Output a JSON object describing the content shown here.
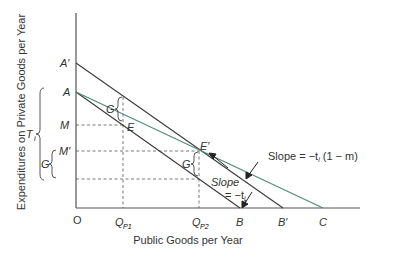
{
  "diagram": {
    "xlabel": "Public Goods per Year",
    "ylabel": "Expenditures on Private Goods per Year",
    "origin": "O",
    "y_points": {
      "A_prime": "A′",
      "A": "A",
      "M": "M",
      "M_prime": "M′"
    },
    "x_points": {
      "Q_P1": "Q",
      "Q_P1_sub": "P1",
      "Q_P2": "Q",
      "Q_P2_sub": "P2",
      "B": "B",
      "B_prime": "B′",
      "C": "C"
    },
    "points": {
      "E": "E",
      "E_prime": "E′"
    },
    "braces": {
      "T_i": "T",
      "T_i_sub": "i",
      "G_left": "G",
      "G_upper": "G",
      "G_lower": "G"
    },
    "annotations": {
      "slope_green_prefix": "Slope = −t",
      "slope_green_sub": "i",
      "slope_green_suffix": " (1 − m)",
      "slope_black_word": "Slope",
      "slope_black_eq": "= −t",
      "slope_black_sub": "i"
    },
    "colors": {
      "line": "#3a3a3a",
      "green_line": "#4f8a7a",
      "dashed": "#555555"
    }
  }
}
